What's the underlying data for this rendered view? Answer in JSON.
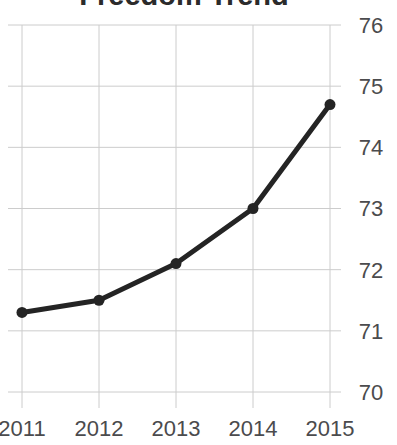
{
  "chart_data": {
    "type": "line",
    "title": "Freedom Trend",
    "x": [
      "2011",
      "2012",
      "2013",
      "2014",
      "2015"
    ],
    "series": [
      {
        "name": "Freedom score",
        "values": [
          71.3,
          71.5,
          72.1,
          73.0,
          74.7
        ]
      }
    ],
    "xlabel": "",
    "ylabel": "",
    "ylim": [
      70,
      76
    ],
    "yticks": [
      70,
      71,
      72,
      73,
      74,
      75,
      76
    ],
    "grid": true,
    "legend": "none",
    "y_axis_side": "right",
    "colors": {
      "line": "#242424",
      "point": "#242424",
      "grid": "#cccccc",
      "tick_label": "#4b4b4d",
      "title": "#2b2b2b",
      "background": "#ffffff"
    }
  }
}
